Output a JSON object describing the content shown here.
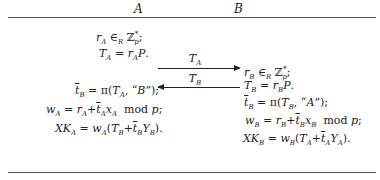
{
  "header": {
    "party_a": "A",
    "party_b": "B"
  },
  "party_a": {
    "lines": [
      "r_A ∈_R Z_p^*;",
      "T_A = r_A P.",
      "t̄_B = π(T_A, \"B\");",
      "w_A = r_A + t̄_A x_A  mod p;",
      "XK_A = w_A(T_B + t̄_B Y_B)."
    ]
  },
  "party_b": {
    "lines": [
      "r_B ∈_R Z_p^*;",
      "T_B = r_B P.",
      "t̄_B = π(T_B, \"A\");",
      "w_B = r_B + t̄_B x_B  mod p;",
      "XK_B = w_B(T_A + t̄_A Y_A)."
    ]
  },
  "messages": [
    {
      "label": "T_A",
      "direction": "A→B"
    },
    {
      "label": "T_B",
      "direction": "B→A"
    }
  ]
}
